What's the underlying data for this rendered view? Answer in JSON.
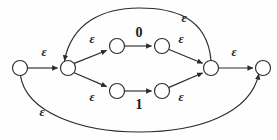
{
  "diagram": {
    "type": "finite-automaton",
    "stroke_color": "#2b2b2b",
    "node_fill": "#ffffff",
    "label_color": "#1a1a1a",
    "background": "#fefefe",
    "states": [
      {
        "id": "q0",
        "name": "state-start",
        "cx": 20,
        "cy": 68,
        "r": 7.5
      },
      {
        "id": "q1",
        "name": "state-branch",
        "cx": 68,
        "cy": 68,
        "r": 7.5
      },
      {
        "id": "q2",
        "name": "state-top-left",
        "cx": 117,
        "cy": 46,
        "r": 7.5
      },
      {
        "id": "q3",
        "name": "state-top-right",
        "cx": 162,
        "cy": 46,
        "r": 7.5
      },
      {
        "id": "q4",
        "name": "state-bottom-left",
        "cx": 117,
        "cy": 91,
        "r": 7.5
      },
      {
        "id": "q5",
        "name": "state-bottom-right",
        "cx": 162,
        "cy": 91,
        "r": 7.5
      },
      {
        "id": "q6",
        "name": "state-merge",
        "cx": 211,
        "cy": 68,
        "r": 7.5
      },
      {
        "id": "q7",
        "name": "state-accept",
        "cx": 263,
        "cy": 68,
        "r": 7.5
      }
    ],
    "transitions": [
      {
        "id": "t1",
        "from": "q0",
        "to": "q1",
        "symbol": "ε",
        "label_x": 44,
        "label_y": 52,
        "kind": "epsilon"
      },
      {
        "id": "t2",
        "from": "q1",
        "to": "q2",
        "symbol": "ε",
        "label_x": 92,
        "label_y": 39,
        "kind": "epsilon"
      },
      {
        "id": "t3",
        "from": "q2",
        "to": "q3",
        "symbol": "0",
        "label_x": 139,
        "label_y": 33,
        "kind": "symbol"
      },
      {
        "id": "t4",
        "from": "q3",
        "to": "q6",
        "symbol": "ε",
        "label_x": 181,
        "label_y": 39,
        "kind": "epsilon"
      },
      {
        "id": "t5",
        "from": "q1",
        "to": "q4",
        "symbol": "ε",
        "label_x": 92,
        "label_y": 97,
        "kind": "epsilon"
      },
      {
        "id": "t6",
        "from": "q4",
        "to": "q5",
        "symbol": "1",
        "label_x": 139,
        "label_y": 105,
        "kind": "symbol"
      },
      {
        "id": "t7",
        "from": "q5",
        "to": "q6",
        "symbol": "ε",
        "label_x": 181,
        "label_y": 97,
        "kind": "epsilon"
      },
      {
        "id": "t8",
        "from": "q6",
        "to": "q7",
        "symbol": "ε",
        "label_x": 234,
        "label_y": 52,
        "kind": "epsilon"
      },
      {
        "id": "t9",
        "from": "q6",
        "to": "q1",
        "symbol": "ε",
        "label_x": 184,
        "label_y": 18,
        "kind": "epsilon-feedback"
      },
      {
        "id": "t10",
        "from": "q0",
        "to": "q7",
        "symbol": "ε",
        "label_x": 42,
        "label_y": 112,
        "kind": "epsilon-bypass"
      }
    ],
    "symbols": {
      "epsilon": "ε",
      "zero": "0",
      "one": "1"
    }
  }
}
